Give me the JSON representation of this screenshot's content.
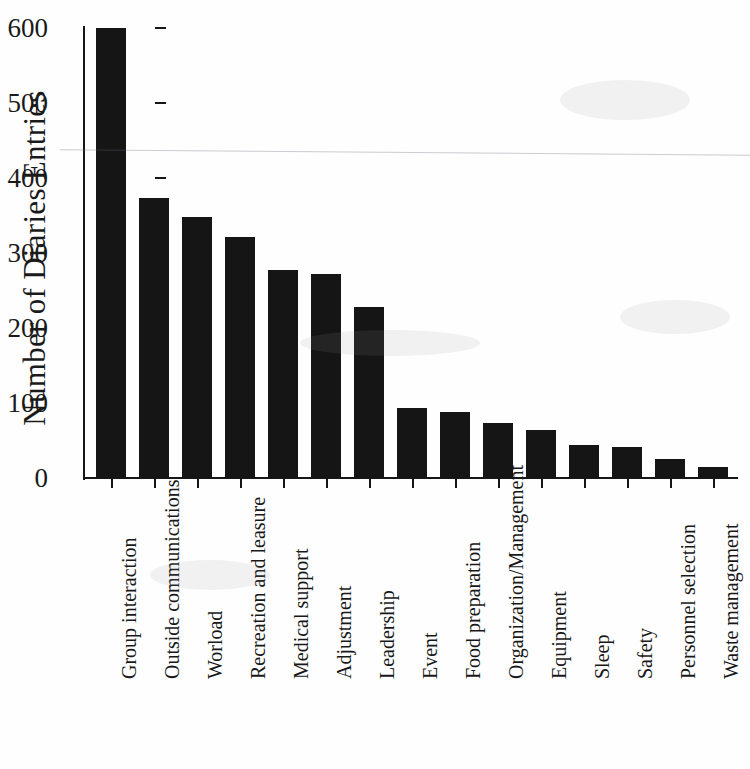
{
  "chart_data": {
    "type": "bar",
    "title": "",
    "xlabel": "",
    "ylabel": "Number of Diaries Entries",
    "ylim": [
      0,
      600
    ],
    "yticks": [
      0,
      100,
      200,
      300,
      400,
      500,
      600
    ],
    "ytick_labels": [
      "0",
      "100",
      "200",
      "300",
      "400",
      "500",
      "600"
    ],
    "grid": false,
    "legend": null,
    "categories": [
      "Group interaction",
      "Outside communications",
      "Worload",
      "Recreation and leasure",
      "Medical support",
      "Adjustment",
      "Leadership",
      "Event",
      "Food preparation",
      "Organization/Management",
      "Equipment",
      "Sleep",
      "Safety",
      "Personnel selection",
      "Waste management"
    ],
    "values": [
      600,
      374,
      348,
      322,
      278,
      272,
      228,
      93,
      88,
      74,
      64,
      44,
      41,
      25,
      15
    ],
    "bar_color": "#151515",
    "axis_color": "#161616"
  }
}
